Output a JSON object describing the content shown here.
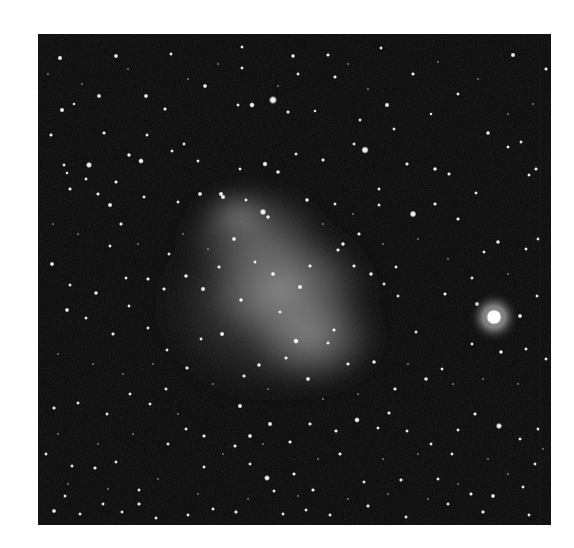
{
  "image": {
    "subject": "star field with irregular dwarf galaxy nebulosity and a bright globular cluster",
    "colors": {
      "page_background": "#ffffff",
      "sky": "#060606",
      "nebula": "#bdbdbd",
      "star": "#ffffff"
    },
    "frame": {
      "x": 38,
      "y": 34,
      "width": 513,
      "height": 491
    },
    "nebula_blobs": [
      {
        "cx": 215,
        "cy": 200,
        "rx": 80,
        "ry": 55,
        "opacity": 0.22
      },
      {
        "cx": 245,
        "cy": 255,
        "rx": 95,
        "ry": 70,
        "opacity": 0.28
      },
      {
        "cx": 275,
        "cy": 305,
        "rx": 75,
        "ry": 55,
        "opacity": 0.26
      },
      {
        "cx": 230,
        "cy": 270,
        "rx": 130,
        "ry": 110,
        "opacity": 0.12
      },
      {
        "cx": 200,
        "cy": 180,
        "rx": 40,
        "ry": 25,
        "opacity": 0.2
      }
    ],
    "cluster": {
      "cx": 456,
      "cy": 283,
      "r": 11,
      "halo": 26
    },
    "stars": [
      [
        22,
        24,
        1.6
      ],
      [
        78,
        22,
        1.5
      ],
      [
        133,
        20,
        1.2
      ],
      [
        204,
        13,
        1.2
      ],
      [
        255,
        22,
        1.4
      ],
      [
        290,
        21,
        1.3
      ],
      [
        343,
        14,
        1.2
      ],
      [
        375,
        40,
        1.3
      ],
      [
        420,
        60,
        1.2
      ],
      [
        475,
        21,
        1.6
      ],
      [
        508,
        35,
        1.3
      ],
      [
        24,
        76,
        1.6
      ],
      [
        36,
        70,
        1.1
      ],
      [
        61,
        62,
        1.5
      ],
      [
        108,
        62,
        1.5
      ],
      [
        127,
        75,
        1.3
      ],
      [
        167,
        52,
        1.5
      ],
      [
        200,
        71,
        1.2
      ],
      [
        204,
        34,
        1.2
      ],
      [
        214,
        71,
        1.8
      ],
      [
        235,
        66,
        2.6
      ],
      [
        250,
        78,
        1.3
      ],
      [
        260,
        40,
        1.2
      ],
      [
        277,
        77,
        1.1
      ],
      [
        297,
        43,
        1.3
      ],
      [
        322,
        86,
        1.2
      ],
      [
        349,
        71,
        1.6
      ],
      [
        393,
        80,
        1.1
      ],
      [
        450,
        99,
        1.4
      ],
      [
        483,
        108,
        1.2
      ],
      [
        498,
        135,
        1.3
      ],
      [
        13,
        101,
        1.3
      ],
      [
        26,
        131,
        1.2
      ],
      [
        51,
        131,
        2.0
      ],
      [
        66,
        99,
        1.3
      ],
      [
        78,
        148,
        1.3
      ],
      [
        91,
        121,
        1.4
      ],
      [
        103,
        127,
        1.8
      ],
      [
        109,
        101,
        1.2
      ],
      [
        134,
        117,
        1.2
      ],
      [
        146,
        110,
        1.2
      ],
      [
        160,
        127,
        1.2
      ],
      [
        183,
        160,
        1.6
      ],
      [
        202,
        135,
        1.2
      ],
      [
        227,
        130,
        1.7
      ],
      [
        240,
        138,
        1.4
      ],
      [
        258,
        120,
        1.2
      ],
      [
        285,
        126,
        1.3
      ],
      [
        316,
        110,
        1.2
      ],
      [
        327,
        116,
        2.4
      ],
      [
        341,
        155,
        1.2
      ],
      [
        356,
        95,
        1.2
      ],
      [
        369,
        130,
        1.3
      ],
      [
        397,
        135,
        1.4
      ],
      [
        411,
        140,
        1.3
      ],
      [
        438,
        159,
        1.2
      ],
      [
        470,
        113,
        1.2
      ],
      [
        491,
        141,
        1.2
      ],
      [
        29,
        139,
        1.1
      ],
      [
        32,
        155,
        1.3
      ],
      [
        48,
        145,
        1.2
      ],
      [
        60,
        160,
        1.3
      ],
      [
        72,
        171,
        1.6
      ],
      [
        83,
        190,
        1.3
      ],
      [
        106,
        163,
        1.2
      ],
      [
        140,
        168,
        1.2
      ],
      [
        162,
        160,
        1.5
      ],
      [
        185,
        163,
        1.6
      ],
      [
        196,
        205,
        1.5
      ],
      [
        208,
        166,
        1.2
      ],
      [
        225,
        178,
        2.1
      ],
      [
        230,
        183,
        1.4
      ],
      [
        269,
        166,
        1.4
      ],
      [
        297,
        170,
        1.2
      ],
      [
        305,
        210,
        1.4
      ],
      [
        321,
        200,
        1.3
      ],
      [
        341,
        171,
        1.2
      ],
      [
        358,
        233,
        1.2
      ],
      [
        375,
        180,
        2.2
      ],
      [
        397,
        170,
        1.3
      ],
      [
        420,
        185,
        1.3
      ],
      [
        446,
        218,
        1.2
      ],
      [
        460,
        208,
        1.4
      ],
      [
        488,
        215,
        1.2
      ],
      [
        500,
        205,
        1.2
      ],
      [
        14,
        230,
        1.5
      ],
      [
        32,
        251,
        1.2
      ],
      [
        58,
        259,
        1.4
      ],
      [
        72,
        212,
        1.2
      ],
      [
        88,
        244,
        1.2
      ],
      [
        110,
        245,
        1.3
      ],
      [
        126,
        255,
        1.3
      ],
      [
        131,
        220,
        1.2
      ],
      [
        148,
        242,
        1.4
      ],
      [
        165,
        255,
        1.6
      ],
      [
        181,
        233,
        1.3
      ],
      [
        203,
        266,
        1.4
      ],
      [
        217,
        228,
        1.2
      ],
      [
        235,
        240,
        1.5
      ],
      [
        242,
        278,
        1.2
      ],
      [
        262,
        253,
        1.6
      ],
      [
        272,
        232,
        1.3
      ],
      [
        296,
        296,
        1.3
      ],
      [
        300,
        216,
        1.3
      ],
      [
        316,
        232,
        1.3
      ],
      [
        333,
        240,
        1.4
      ],
      [
        346,
        250,
        1.2
      ],
      [
        360,
        262,
        1.2
      ],
      [
        378,
        298,
        1.2
      ],
      [
        407,
        260,
        1.3
      ],
      [
        434,
        244,
        1.2
      ],
      [
        439,
        270,
        1.5
      ],
      [
        482,
        282,
        1.5
      ],
      [
        499,
        262,
        1.2
      ],
      [
        29,
        276,
        1.5
      ],
      [
        48,
        284,
        1.2
      ],
      [
        75,
        300,
        1.3
      ],
      [
        91,
        272,
        1.2
      ],
      [
        110,
        294,
        1.2
      ],
      [
        129,
        316,
        1.2
      ],
      [
        149,
        334,
        1.3
      ],
      [
        163,
        305,
        1.2
      ],
      [
        184,
        300,
        1.6
      ],
      [
        206,
        342,
        1.3
      ],
      [
        221,
        331,
        1.4
      ],
      [
        248,
        324,
        1.3
      ],
      [
        258,
        307,
        1.8
      ],
      [
        270,
        345,
        1.5
      ],
      [
        290,
        309,
        1.2
      ],
      [
        310,
        330,
        1.3
      ],
      [
        336,
        328,
        1.4
      ],
      [
        357,
        355,
        1.3
      ],
      [
        388,
        345,
        1.4
      ],
      [
        404,
        335,
        1.2
      ],
      [
        434,
        310,
        1.2
      ],
      [
        463,
        318,
        1.4
      ],
      [
        488,
        315,
        1.2
      ],
      [
        508,
        325,
        1.2
      ],
      [
        16,
        374,
        1.3
      ],
      [
        40,
        369,
        1.2
      ],
      [
        69,
        380,
        1.2
      ],
      [
        92,
        360,
        1.2
      ],
      [
        112,
        370,
        1.2
      ],
      [
        128,
        355,
        1.2
      ],
      [
        148,
        395,
        1.2
      ],
      [
        166,
        402,
        1.3
      ],
      [
        202,
        372,
        1.6
      ],
      [
        212,
        402,
        1.5
      ],
      [
        232,
        390,
        1.6
      ],
      [
        252,
        408,
        1.3
      ],
      [
        272,
        390,
        1.3
      ],
      [
        298,
        397,
        1.3
      ],
      [
        319,
        386,
        1.8
      ],
      [
        340,
        394,
        1.2
      ],
      [
        351,
        379,
        1.3
      ],
      [
        369,
        397,
        1.2
      ],
      [
        393,
        410,
        1.2
      ],
      [
        420,
        396,
        1.2
      ],
      [
        437,
        380,
        1.3
      ],
      [
        461,
        392,
        2.0
      ],
      [
        482,
        405,
        1.2
      ],
      [
        500,
        395,
        1.2
      ],
      [
        8,
        420,
        1.2
      ],
      [
        34,
        432,
        1.2
      ],
      [
        57,
        434,
        1.3
      ],
      [
        78,
        428,
        1.2
      ],
      [
        101,
        456,
        1.2
      ],
      [
        130,
        410,
        1.2
      ],
      [
        166,
        433,
        1.2
      ],
      [
        197,
        412,
        1.3
      ],
      [
        212,
        430,
        1.2
      ],
      [
        236,
        457,
        1.2
      ],
      [
        256,
        440,
        1.3
      ],
      [
        275,
        456,
        1.3
      ],
      [
        302,
        420,
        1.3
      ],
      [
        326,
        448,
        1.2
      ],
      [
        363,
        446,
        1.3
      ],
      [
        400,
        445,
        1.2
      ],
      [
        414,
        420,
        1.2
      ],
      [
        433,
        460,
        1.3
      ],
      [
        455,
        462,
        1.5
      ],
      [
        485,
        453,
        1.2
      ],
      [
        497,
        430,
        1.2
      ],
      [
        16,
        477,
        1.5
      ],
      [
        27,
        462,
        1.2
      ],
      [
        42,
        480,
        1.2
      ],
      [
        65,
        470,
        1.2
      ],
      [
        84,
        478,
        1.2
      ],
      [
        101,
        470,
        1.3
      ],
      [
        118,
        484,
        1.2
      ],
      [
        150,
        481,
        1.2
      ],
      [
        175,
        475,
        1.2
      ],
      [
        198,
        478,
        1.3
      ],
      [
        229,
        444,
        1.9
      ],
      [
        245,
        480,
        1.2
      ],
      [
        268,
        476,
        1.2
      ],
      [
        292,
        481,
        1.2
      ],
      [
        330,
        472,
        1.3
      ],
      [
        368,
        483,
        1.2
      ],
      [
        410,
        470,
        1.2
      ],
      [
        445,
        478,
        1.3
      ],
      [
        491,
        481,
        1.2
      ]
    ],
    "faint_stars": [
      [
        10,
        40
      ],
      [
        44,
        50
      ],
      [
        90,
        35
      ],
      [
        150,
        45
      ],
      [
        180,
        30
      ],
      [
        240,
        52
      ],
      [
        310,
        30
      ],
      [
        330,
        55
      ],
      [
        400,
        28
      ],
      [
        440,
        45
      ],
      [
        470,
        80
      ],
      [
        495,
        70
      ],
      [
        15,
        190
      ],
      [
        40,
        200
      ],
      [
        100,
        210
      ],
      [
        145,
        200
      ],
      [
        170,
        215
      ],
      [
        285,
        190
      ],
      [
        315,
        180
      ],
      [
        345,
        210
      ],
      [
        380,
        205
      ],
      [
        410,
        225
      ],
      [
        470,
        240
      ],
      [
        20,
        320
      ],
      [
        55,
        330
      ],
      [
        85,
        340
      ],
      [
        115,
        330
      ],
      [
        175,
        350
      ],
      [
        230,
        355
      ],
      [
        285,
        365
      ],
      [
        320,
        360
      ],
      [
        370,
        330
      ],
      [
        415,
        350
      ],
      [
        445,
        345
      ],
      [
        480,
        350
      ],
      [
        20,
        400
      ],
      [
        60,
        410
      ],
      [
        95,
        400
      ],
      [
        140,
        380
      ],
      [
        185,
        420
      ],
      [
        225,
        410
      ],
      [
        280,
        425
      ],
      [
        345,
        425
      ],
      [
        380,
        420
      ],
      [
        450,
        425
      ],
      [
        505,
        415
      ],
      [
        30,
        450
      ],
      [
        70,
        455
      ],
      [
        120,
        445
      ],
      [
        160,
        460
      ],
      [
        210,
        465
      ],
      [
        260,
        462
      ],
      [
        310,
        465
      ],
      [
        350,
        460
      ],
      [
        390,
        465
      ],
      [
        420,
        450
      ],
      [
        470,
        440
      ]
    ]
  }
}
